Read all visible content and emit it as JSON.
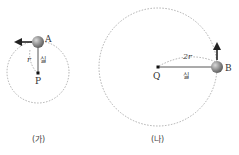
{
  "figures": [
    {
      "id": "ga",
      "caption": "(가)",
      "center_label": "P",
      "ball_label": "A",
      "radius_label": "r",
      "string_label": "실",
      "velocity_direction": "left"
    },
    {
      "id": "na",
      "caption": "(나)",
      "center_label": "Q",
      "ball_label": "B",
      "radius_label": "2r",
      "string_label": "실",
      "velocity_direction": "up"
    }
  ],
  "colors": {
    "ball": "#8a8a8a",
    "string": "#444444",
    "dashed_circle": "#9a9a9a",
    "arrow": "#222222"
  }
}
